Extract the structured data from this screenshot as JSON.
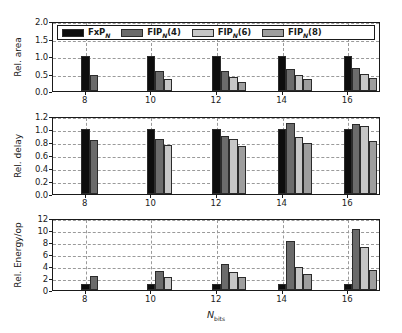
{
  "chart_data": {
    "type": "bar",
    "title": "",
    "xlabel": "N_bits",
    "xlabel_main": "N",
    "xlabel_sub": "bits",
    "categories": [
      "8",
      "10",
      "12",
      "14",
      "16"
    ],
    "grid": true,
    "legend_position": "top-left-inside-panel-1",
    "series_names": [
      "FxP_N",
      "FIP_N(4)",
      "FIP_N(6)",
      "FIP_N(8)"
    ],
    "colors": [
      "#0d0d0d",
      "#6b6b6b",
      "#c6c6c6",
      "#9e9e9e"
    ],
    "panels": [
      {
        "ylabel": "Rel. area",
        "ylim": [
          0.0,
          2.0
        ],
        "yticks": [
          "0.0",
          "0.5",
          "1.0",
          "1.5",
          "2.0"
        ],
        "ytick_values": [
          0.0,
          0.5,
          1.0,
          1.5,
          2.0
        ],
        "series": [
          {
            "name": "FxP_N",
            "values": [
              1.0,
              1.0,
              1.0,
              1.0,
              1.0
            ]
          },
          {
            "name": "FIP_N(4)",
            "values": [
              0.45,
              0.56,
              0.58,
              0.62,
              0.66
            ]
          },
          {
            "name": "FIP_N(6)",
            "values": [
              null,
              0.34,
              0.4,
              0.47,
              0.5
            ]
          },
          {
            "name": "FIP_N(8)",
            "values": [
              null,
              null,
              0.27,
              0.33,
              0.38
            ]
          }
        ]
      },
      {
        "ylabel": "Rel. delay",
        "ylim": [
          0.0,
          1.2
        ],
        "yticks": [
          "0.0",
          "0.2",
          "0.4",
          "0.6",
          "0.8",
          "1.0",
          "1.2"
        ],
        "ytick_values": [
          0.0,
          0.2,
          0.4,
          0.6,
          0.8,
          1.0,
          1.2
        ],
        "series": [
          {
            "name": "FxP_N",
            "values": [
              1.0,
              1.0,
              1.0,
              1.0,
              1.0
            ]
          },
          {
            "name": "FIP_N(4)",
            "values": [
              0.83,
              0.85,
              0.89,
              1.09,
              1.07
            ]
          },
          {
            "name": "FIP_N(6)",
            "values": [
              null,
              0.76,
              0.84,
              0.87,
              1.04
            ]
          },
          {
            "name": "FIP_N(8)",
            "values": [
              null,
              null,
              0.74,
              0.79,
              0.81
            ]
          }
        ]
      },
      {
        "ylabel": "Rel. Energy/op",
        "ylim": [
          0,
          12
        ],
        "yticks": [
          "0",
          "2",
          "4",
          "6",
          "8",
          "10",
          "12"
        ],
        "ytick_values": [
          0,
          2,
          4,
          6,
          8,
          10,
          12
        ],
        "series": [
          {
            "name": "FxP_N",
            "values": [
              1.0,
              1.0,
              1.0,
              1.0,
              1.0
            ]
          },
          {
            "name": "FIP_N(4)",
            "values": [
              2.3,
              3.1,
              4.3,
              8.1,
              10.2
            ]
          },
          {
            "name": "FIP_N(6)",
            "values": [
              null,
              2.15,
              3.0,
              3.8,
              7.1
            ]
          },
          {
            "name": "FIP_N(8)",
            "values": [
              null,
              null,
              2.15,
              2.6,
              3.4
            ]
          }
        ]
      }
    ]
  },
  "legend": {
    "items": [
      {
        "label_main": "FxP",
        "label_sub": "N",
        "label_tail": "",
        "color": "#0d0d0d"
      },
      {
        "label_main": "FIP",
        "label_sub": "N",
        "label_tail": "(4)",
        "color": "#6b6b6b"
      },
      {
        "label_main": "FIP",
        "label_sub": "N",
        "label_tail": "(6)",
        "color": "#c6c6c6"
      },
      {
        "label_main": "FIP",
        "label_sub": "N",
        "label_tail": "(8)",
        "color": "#9e9e9e"
      }
    ]
  }
}
